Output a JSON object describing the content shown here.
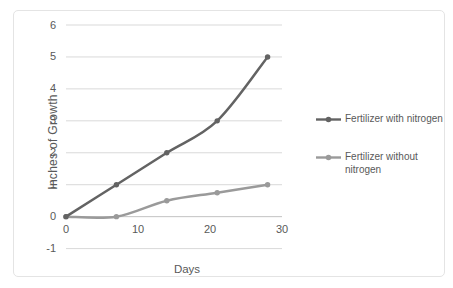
{
  "chart_data": {
    "type": "line",
    "x": [
      0,
      7,
      14,
      21,
      28
    ],
    "series": [
      {
        "name": "Fertilizer with nitrogen",
        "values": [
          0,
          1,
          2,
          3,
          5
        ],
        "color": "#636363"
      },
      {
        "name": "Fertilizer without nitrogen",
        "values": [
          0,
          0,
          0.5,
          0.75,
          1
        ],
        "color": "#9a9a9a"
      }
    ],
    "title": "",
    "xlabel": "Days",
    "ylabel": "Inches of Growth",
    "xlim": [
      0,
      30
    ],
    "ylim": [
      -1,
      6
    ],
    "xticks": [
      0,
      10,
      20,
      30
    ],
    "yticks": [
      -1,
      0,
      1,
      2,
      3,
      4,
      5,
      6
    ],
    "grid": true,
    "smooth": true,
    "markers": true,
    "legend_position": "right"
  },
  "colors": {
    "series_with_nitrogen": "#636363",
    "series_without_nitrogen": "#9a9a9a",
    "gridline": "#d9d9d9",
    "axis_line": "#c2c2c2",
    "text": "#595959",
    "frame_border": "#e4e4e4",
    "background": "#ffffff"
  }
}
